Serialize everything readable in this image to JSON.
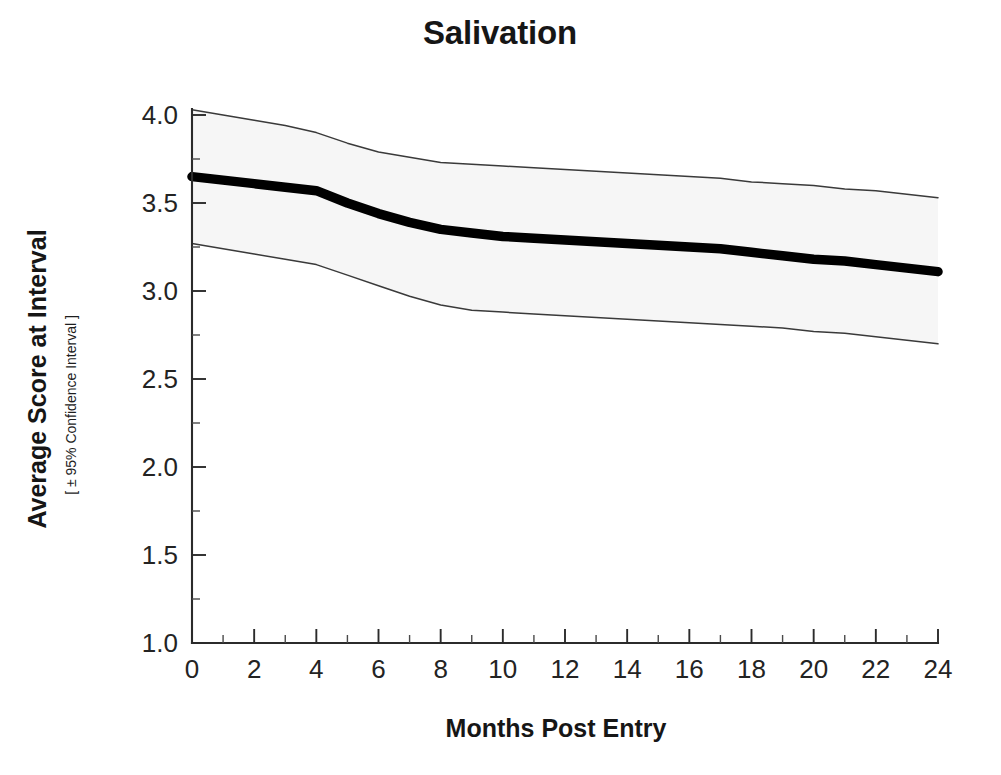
{
  "chart_data": {
    "type": "line",
    "title": "Salivation",
    "xlabel": "Months Post Entry",
    "ylabel": "Average Score at Interval",
    "ylabel_sub": "[ ± 95% Confidence Interval ]",
    "xlim": [
      0,
      24
    ],
    "ylim": [
      1.0,
      4.0
    ],
    "grid": false,
    "legend": null,
    "xticks": [
      0,
      2,
      4,
      6,
      8,
      10,
      12,
      14,
      16,
      18,
      20,
      22,
      24
    ],
    "xtick_labels": [
      "0",
      "2",
      "4",
      "6",
      "8",
      "10",
      "12",
      "14",
      "16",
      "18",
      "20",
      "22",
      "24"
    ],
    "x_minor_step": 1,
    "yticks": [
      1.0,
      1.5,
      2.0,
      2.5,
      3.0,
      3.5,
      4.0
    ],
    "ytick_labels": [
      "1.0",
      "1.5",
      "2.0",
      "2.5",
      "3.0",
      "3.5",
      "4.0"
    ],
    "y_minor_step": 0.25,
    "x": [
      0,
      1,
      2,
      3,
      4,
      5,
      6,
      7,
      8,
      9,
      10,
      11,
      12,
      13,
      14,
      15,
      16,
      17,
      18,
      19,
      20,
      21,
      22,
      23,
      24
    ],
    "series": [
      {
        "name": "Average Score",
        "style": "thick-black-line",
        "color": "#000000",
        "values": [
          3.65,
          3.63,
          3.61,
          3.59,
          3.57,
          3.5,
          3.44,
          3.39,
          3.35,
          3.33,
          3.31,
          3.3,
          3.29,
          3.28,
          3.27,
          3.26,
          3.25,
          3.24,
          3.22,
          3.2,
          3.18,
          3.17,
          3.15,
          3.13,
          3.11
        ]
      },
      {
        "name": "Upper 95% Confidence Limit",
        "style": "thin-line",
        "color": "#3a3a3a",
        "values": [
          4.03,
          4.0,
          3.97,
          3.94,
          3.9,
          3.84,
          3.79,
          3.76,
          3.73,
          3.72,
          3.71,
          3.7,
          3.69,
          3.68,
          3.67,
          3.66,
          3.65,
          3.64,
          3.62,
          3.61,
          3.6,
          3.58,
          3.57,
          3.55,
          3.53
        ]
      },
      {
        "name": "Lower 95% Confidence Limit",
        "style": "thin-line",
        "color": "#3a3a3a",
        "values": [
          3.27,
          3.24,
          3.21,
          3.18,
          3.15,
          3.09,
          3.03,
          2.97,
          2.92,
          2.89,
          2.88,
          2.87,
          2.86,
          2.85,
          2.84,
          2.83,
          2.82,
          2.81,
          2.8,
          2.79,
          2.77,
          2.76,
          2.74,
          2.72,
          2.7
        ]
      }
    ],
    "band": {
      "name": "95% Confidence Band",
      "fill": "#f6f6f6",
      "upper_series": "Upper 95% Confidence Limit",
      "lower_series": "Lower 95% Confidence Limit"
    }
  },
  "plot_geometry": {
    "left": 192,
    "right": 938,
    "top": 115,
    "bottom": 643
  }
}
